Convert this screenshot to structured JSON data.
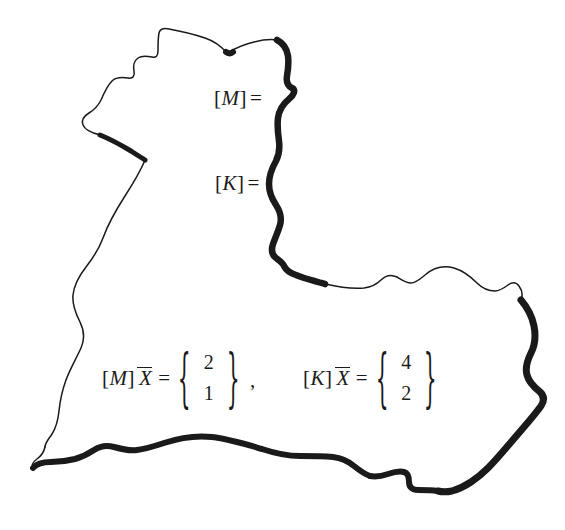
{
  "figure": {
    "kind": "textbook-figure-blob-frame",
    "background_color": "#ffffff",
    "ink_color": "#1a1a1a",
    "outline": {
      "name": "hand-drawn-irregular-blob",
      "description": "Closed freehand cloud-like contour with variable stroke weight: thin along the upper-left and left edges, thick along the right edge and the bottom edge.",
      "thin_stroke_px": 1.4,
      "thick_stroke_px": 7
    }
  },
  "labels": {
    "mass_matrix": {
      "open_bracket": "[",
      "symbol": "M",
      "close_bracket": "]",
      "equals": "="
    },
    "stiffness_matrix": {
      "open_bracket": "[",
      "symbol": "K",
      "close_bracket": "]",
      "equals": "="
    }
  },
  "equations": [
    {
      "id": "mass-equation",
      "matrix_open": "[",
      "matrix_symbol": "M",
      "matrix_close": "]",
      "vector_symbol": "X",
      "vector_overline": true,
      "equals": "=",
      "brace_open": "{",
      "brace_close": "}",
      "values": [
        "2",
        "1"
      ]
    },
    {
      "id": "stiffness-equation",
      "matrix_open": "[",
      "matrix_symbol": "K",
      "matrix_close": "]",
      "vector_symbol": "X",
      "vector_overline": true,
      "equals": "=",
      "brace_open": "{",
      "brace_close": "}",
      "values": [
        "4",
        "2"
      ]
    }
  ],
  "separator": ","
}
